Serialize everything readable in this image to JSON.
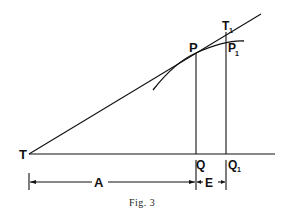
{
  "figure": {
    "caption": "Fig. 3",
    "labels": {
      "T": "T",
      "T1": "T",
      "T1_sub": "1",
      "P": "P",
      "P1": "P",
      "P1_sub": "1",
      "Q": "Q",
      "Q1": "Q",
      "Q1_sub": "1",
      "A": "A",
      "E": "E"
    }
  }
}
